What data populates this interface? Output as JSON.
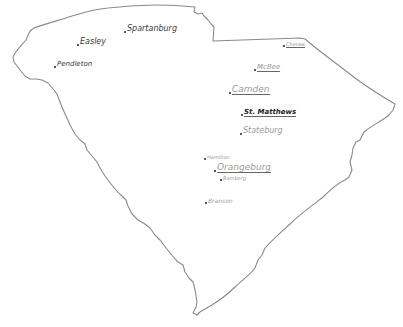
{
  "map": {
    "subject": "South Carolina hand-drawn outline",
    "outline_color": "#8a8a8a",
    "cities": [
      {
        "id": "easley",
        "name": "Easley",
        "x": 78,
        "y": 38,
        "size": 8,
        "style": ""
      },
      {
        "id": "spartanburg",
        "name": "Spartanburg",
        "x": 125,
        "y": 26,
        "size": 8,
        "style": ""
      },
      {
        "id": "pendleton",
        "name": "Pendleton",
        "x": 55,
        "y": 61,
        "size": 7,
        "style": ""
      },
      {
        "id": "cheraw",
        "name": "Cheraw",
        "x": 283,
        "y": 41,
        "size": 5,
        "style": "underlined faint"
      },
      {
        "id": "mcbee",
        "name": "McBee",
        "x": 255,
        "y": 64,
        "size": 7,
        "style": "underlined faint"
      },
      {
        "id": "camden",
        "name": "Camden",
        "x": 230,
        "y": 86,
        "size": 8,
        "style": "underlined faint"
      },
      {
        "id": "st-matthews",
        "name": "St. Matthews",
        "x": 242,
        "y": 109,
        "size": 7,
        "style": "underlined bold"
      },
      {
        "id": "stateburg",
        "name": "Stateburg",
        "x": 240,
        "y": 127,
        "size": 7,
        "style": "faint"
      },
      {
        "id": "hamilton",
        "name": "Hamilton",
        "x": 204,
        "y": 156,
        "size": 5,
        "style": "faint"
      },
      {
        "id": "orangeburg",
        "name": "Orangeburg",
        "x": 215,
        "y": 164,
        "size": 9,
        "style": "underlined faint"
      },
      {
        "id": "ramberg",
        "name": "Ramberg",
        "x": 220,
        "y": 176,
        "size": 5,
        "style": "faint"
      },
      {
        "id": "branson",
        "name": "Branson",
        "x": 205,
        "y": 198,
        "size": 6,
        "style": "faint"
      }
    ]
  }
}
